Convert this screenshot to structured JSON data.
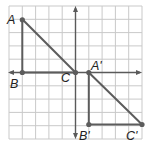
{
  "figure": {
    "type": "coordinate-grid transformation diagram",
    "grid": {
      "columns": 10,
      "rows": 10
    },
    "colors": {
      "background": "#ffffff",
      "grid": "#c9c9c9",
      "axis": "#5a5a5a",
      "edges": "#5c5c5c",
      "labels": "#222222"
    },
    "labels": {
      "A": "A",
      "B": "B",
      "C": "C",
      "A_prime": "A'",
      "B_prime": "B'",
      "C_prime": "C'"
    },
    "original_triangle": {
      "vertices": {
        "A": [
          -4,
          4
        ],
        "B": [
          -4,
          0
        ],
        "C": [
          0,
          0
        ]
      }
    },
    "image_triangle": {
      "vertices": {
        "A_prime": [
          1,
          0
        ],
        "B_prime": [
          1,
          -4
        ],
        "C_prime": [
          5,
          -4
        ]
      }
    }
  }
}
